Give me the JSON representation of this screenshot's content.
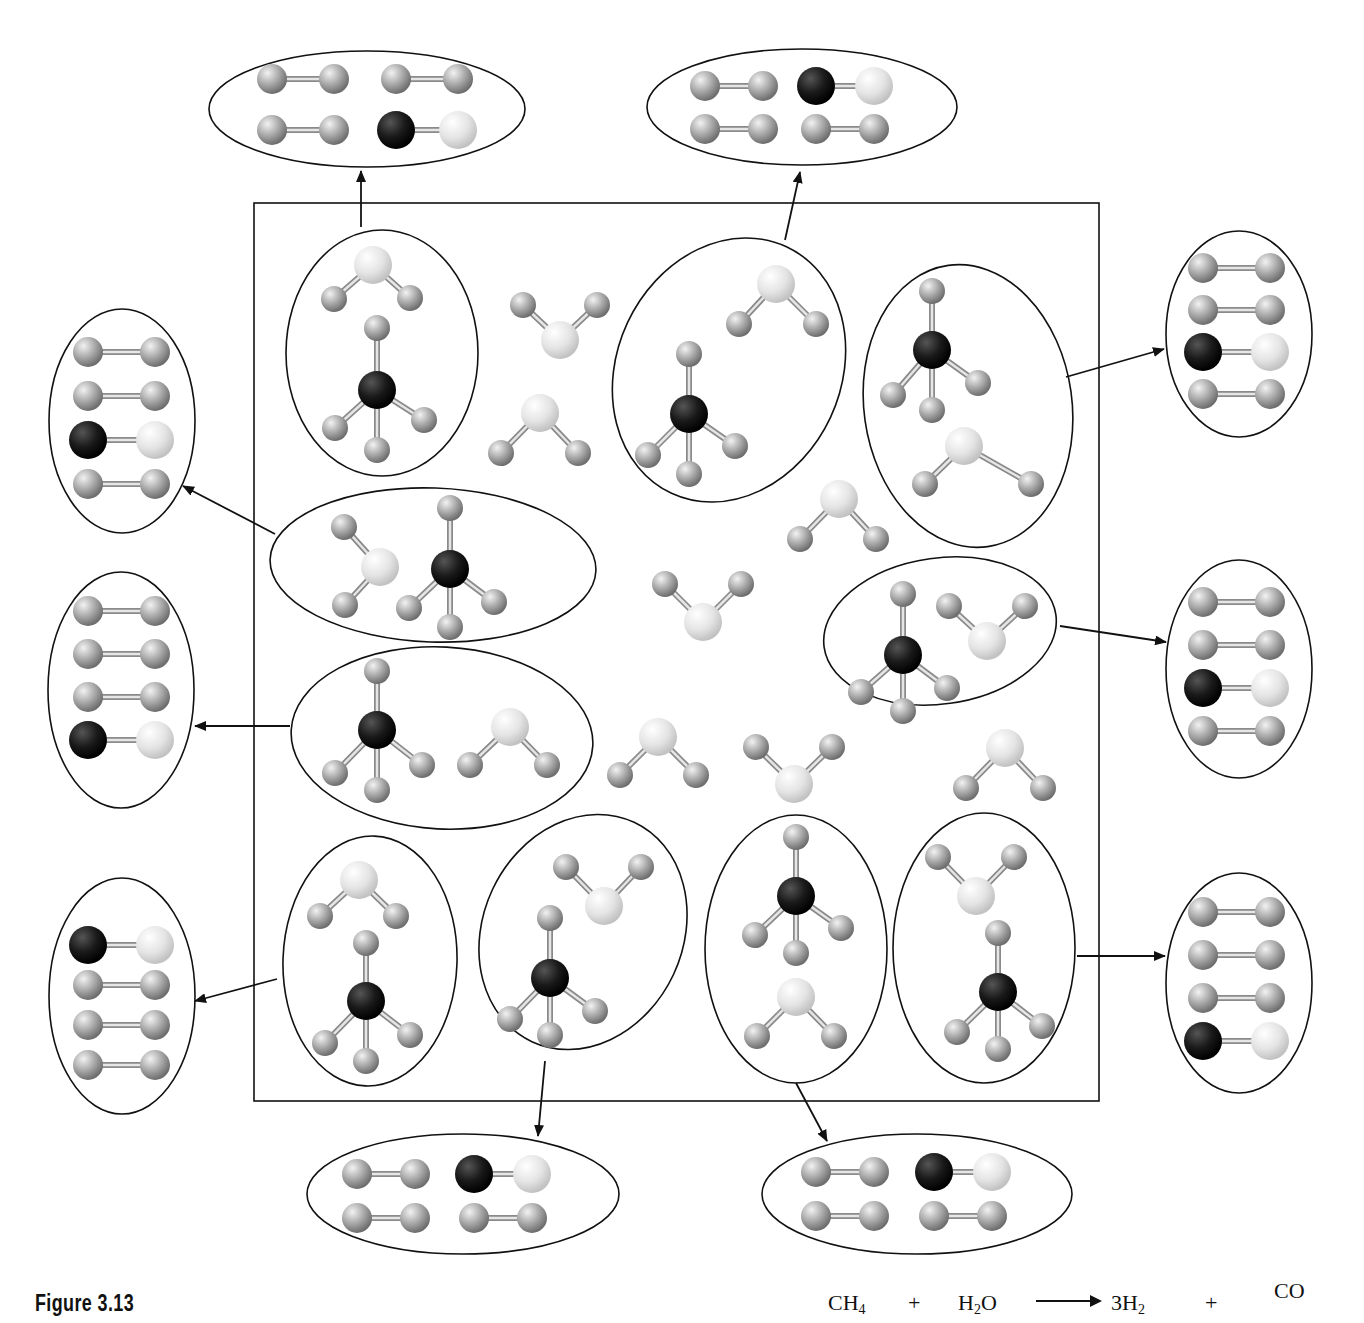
{
  "figure": {
    "caption": "Figure 3.13",
    "equation": {
      "reactant1": "CH",
      "reactant1_sub": "4",
      "plus1": "+",
      "reactant2_a": "H",
      "reactant2_sub": "2",
      "reactant2_b": "O",
      "arrow": "yields-arrow",
      "product1": "3H",
      "product1_sub": "2",
      "plus2": "+",
      "product2": "CO"
    }
  },
  "colors": {
    "carbon": "#111111",
    "oxygen": "#e4e4e4",
    "hydrogen": "#a9a9a9",
    "outline": "#111111",
    "bond": "#bdbdbd"
  },
  "box": {
    "x": 254,
    "y": 203,
    "w": 845,
    "h": 898
  },
  "reactant_groups": [
    {
      "id": "g1",
      "cx": 382,
      "cy": 353,
      "rx": 96,
      "ry": 123,
      "rot": 0
    },
    {
      "id": "g2",
      "cx": 729,
      "cy": 370,
      "rx": 112,
      "ry": 136,
      "rot": 25
    },
    {
      "id": "g3",
      "cx": 968,
      "cy": 406,
      "rx": 104,
      "ry": 142,
      "rot": -8
    },
    {
      "id": "g4",
      "cx": 433,
      "cy": 565,
      "rx": 163,
      "ry": 77,
      "rot": 2
    },
    {
      "id": "g5",
      "cx": 940,
      "cy": 631,
      "rx": 117,
      "ry": 73,
      "rot": -8
    },
    {
      "id": "g6",
      "cx": 442,
      "cy": 738,
      "rx": 151,
      "ry": 91,
      "rot": 3
    },
    {
      "id": "g7",
      "cx": 370,
      "cy": 961,
      "rx": 87,
      "ry": 125,
      "rot": 2
    },
    {
      "id": "g8",
      "cx": 583,
      "cy": 932,
      "rx": 100,
      "ry": 121,
      "rot": 25
    },
    {
      "id": "g9",
      "cx": 796,
      "cy": 949,
      "rx": 91,
      "ry": 134,
      "rot": 0
    },
    {
      "id": "g10",
      "cx": 984,
      "cy": 948,
      "rx": 91,
      "ry": 135,
      "rot": 0
    }
  ],
  "methane": [
    {
      "cx": 377,
      "cy": 390,
      "h": [
        [
          377,
          328
        ],
        [
          335,
          428
        ],
        [
          377,
          450
        ],
        [
          424,
          420
        ]
      ]
    },
    {
      "cx": 689,
      "cy": 414,
      "h": [
        [
          689,
          354
        ],
        [
          648,
          455
        ],
        [
          689,
          474
        ],
        [
          735,
          446
        ]
      ]
    },
    {
      "cx": 932,
      "cy": 350,
      "h": [
        [
          932,
          291
        ],
        [
          893,
          395
        ],
        [
          932,
          410
        ],
        [
          978,
          383
        ]
      ]
    },
    {
      "cx": 450,
      "cy": 569,
      "h": [
        [
          450,
          508
        ],
        [
          409,
          608
        ],
        [
          450,
          627
        ],
        [
          494,
          602
        ]
      ]
    },
    {
      "cx": 903,
      "cy": 655,
      "h": [
        [
          903,
          594
        ],
        [
          861,
          692
        ],
        [
          903,
          711
        ],
        [
          947,
          688
        ]
      ]
    },
    {
      "cx": 377,
      "cy": 730,
      "h": [
        [
          377,
          671
        ],
        [
          335,
          773
        ],
        [
          377,
          790
        ],
        [
          422,
          765
        ]
      ]
    },
    {
      "cx": 366,
      "cy": 1001,
      "h": [
        [
          366,
          943
        ],
        [
          325,
          1043
        ],
        [
          366,
          1061
        ],
        [
          410,
          1035
        ]
      ]
    },
    {
      "cx": 550,
      "cy": 978,
      "h": [
        [
          550,
          918
        ],
        [
          510,
          1019
        ],
        [
          550,
          1035
        ],
        [
          595,
          1011
        ]
      ]
    },
    {
      "cx": 796,
      "cy": 896,
      "h": [
        [
          796,
          837
        ],
        [
          755,
          935
        ],
        [
          796,
          953
        ],
        [
          841,
          928
        ]
      ]
    },
    {
      "cx": 998,
      "cy": 992,
      "h": [
        [
          998,
          933
        ],
        [
          957,
          1032
        ],
        [
          998,
          1049
        ],
        [
          1042,
          1026
        ]
      ]
    }
  ],
  "water": [
    {
      "o": [
        373,
        265
      ],
      "h": [
        [
          334,
          299
        ],
        [
          410,
          298
        ]
      ]
    },
    {
      "o": [
        560,
        340
      ],
      "h": [
        [
          523,
          305
        ],
        [
          597,
          305
        ]
      ]
    },
    {
      "o": [
        540,
        413
      ],
      "h": [
        [
          501,
          453
        ],
        [
          578,
          453
        ]
      ]
    },
    {
      "o": [
        776,
        284
      ],
      "h": [
        [
          739,
          324
        ],
        [
          816,
          324
        ]
      ]
    },
    {
      "o": [
        964,
        446
      ],
      "h": [
        [
          925,
          484
        ],
        [
          1031,
          484
        ]
      ]
    },
    {
      "o": [
        839,
        499
      ],
      "h": [
        [
          800,
          539
        ],
        [
          876,
          539
        ]
      ]
    },
    {
      "o": [
        380,
        567
      ],
      "h": [
        [
          344,
          527
        ],
        [
          345,
          605
        ]
      ]
    },
    {
      "o": [
        703,
        622
      ],
      "h": [
        [
          665,
          584
        ],
        [
          741,
          584
        ]
      ]
    },
    {
      "o": [
        987,
        641
      ],
      "h": [
        [
          949,
          606
        ],
        [
          1025,
          606
        ]
      ]
    },
    {
      "o": [
        510,
        727
      ],
      "h": [
        [
          470,
          765
        ],
        [
          547,
          765
        ]
      ]
    },
    {
      "o": [
        658,
        737
      ],
      "h": [
        [
          620,
          775
        ],
        [
          696,
          775
        ]
      ]
    },
    {
      "o": [
        794,
        784
      ],
      "h": [
        [
          756,
          747
        ],
        [
          832,
          747
        ]
      ]
    },
    {
      "o": [
        1005,
        748
      ],
      "h": [
        [
          966,
          788
        ],
        [
          1043,
          788
        ]
      ]
    },
    {
      "o": [
        359,
        880
      ],
      "h": [
        [
          320,
          916
        ],
        [
          396,
          916
        ]
      ]
    },
    {
      "o": [
        604,
        906
      ],
      "h": [
        [
          566,
          867
        ],
        [
          641,
          867
        ]
      ]
    },
    {
      "o": [
        796,
        997
      ],
      "h": [
        [
          757,
          1036
        ],
        [
          834,
          1036
        ]
      ]
    },
    {
      "o": [
        976,
        896
      ],
      "h": [
        [
          938,
          857
        ],
        [
          1014,
          857
        ]
      ]
    }
  ],
  "product_groups": [
    {
      "id": "p-top-left",
      "cx": 367,
      "cy": 109,
      "rx": 158,
      "ry": 58,
      "layout": "grid",
      "rows": [
        [
          "HH",
          "HH"
        ],
        [
          "HH",
          "CO"
        ]
      ],
      "origin": [
        272,
        79
      ],
      "dx": 124,
      "dy": 51,
      "len": 62,
      "arrow": {
        "from": [
          361,
          227
        ],
        "to": [
          361,
          171
        ]
      }
    },
    {
      "id": "p-top-right",
      "cx": 802,
      "cy": 107,
      "rx": 155,
      "ry": 58,
      "layout": "grid",
      "rows": [
        [
          "HH",
          "CO"
        ],
        [
          "HH",
          "HH"
        ]
      ],
      "origin": [
        705,
        86
      ],
      "dx": 111,
      "dy": 43,
      "len": 58,
      "arrow": {
        "from": [
          785,
          240
        ],
        "to": [
          800,
          172
        ]
      }
    },
    {
      "id": "p-left-1",
      "cx": 122,
      "cy": 421,
      "rx": 73,
      "ry": 112,
      "layout": "column",
      "rows": [
        "HH",
        "HH",
        "CO",
        "HH"
      ],
      "origin": [
        88,
        352
      ],
      "dy": 44,
      "len": 67,
      "arrow": {
        "from": [
          275,
          534
        ],
        "to": [
          183,
          486
        ]
      }
    },
    {
      "id": "p-left-2",
      "cx": 121,
      "cy": 690,
      "rx": 73,
      "ry": 118,
      "layout": "column",
      "rows": [
        "HH",
        "HH",
        "HH",
        "CO"
      ],
      "origin": [
        88,
        611
      ],
      "dy": 43,
      "len": 67,
      "arrow": {
        "from": [
          290,
          726
        ],
        "to": [
          195,
          726
        ]
      }
    },
    {
      "id": "p-left-3",
      "cx": 122,
      "cy": 996,
      "rx": 73,
      "ry": 118,
      "layout": "column",
      "rows": [
        "CO",
        "HH",
        "HH",
        "HH"
      ],
      "origin": [
        88,
        945
      ],
      "dy": 40,
      "len": 67,
      "arrow": {
        "from": [
          277,
          979
        ],
        "to": [
          195,
          1001
        ]
      }
    },
    {
      "id": "p-right-1",
      "cx": 1239,
      "cy": 334,
      "rx": 73,
      "ry": 103,
      "layout": "column",
      "rows": [
        "HH",
        "HH",
        "CO",
        "HH"
      ],
      "origin": [
        1203,
        268
      ],
      "dy": 42,
      "len": 67,
      "arrow": {
        "from": [
          1066,
          377
        ],
        "to": [
          1164,
          349
        ]
      }
    },
    {
      "id": "p-right-2",
      "cx": 1239,
      "cy": 669,
      "rx": 73,
      "ry": 109,
      "layout": "column",
      "rows": [
        "HH",
        "HH",
        "CO",
        "HH"
      ],
      "origin": [
        1203,
        602
      ],
      "dy": 43,
      "len": 67,
      "arrow": {
        "from": [
          1060,
          626
        ],
        "to": [
          1166,
          642
        ]
      }
    },
    {
      "id": "p-right-3",
      "cx": 1239,
      "cy": 983,
      "rx": 73,
      "ry": 110,
      "layout": "column",
      "rows": [
        "HH",
        "HH",
        "HH",
        "CO"
      ],
      "origin": [
        1203,
        912
      ],
      "dy": 43,
      "len": 67,
      "arrow": {
        "from": [
          1077,
          956
        ],
        "to": [
          1165,
          956
        ]
      }
    },
    {
      "id": "p-bottom-left",
      "cx": 463,
      "cy": 1194,
      "rx": 156,
      "ry": 60,
      "layout": "grid",
      "rows": [
        [
          "HH",
          "CO"
        ],
        [
          "HH",
          "HH"
        ]
      ],
      "origin": [
        357,
        1174
      ],
      "dx": 117,
      "dy": 44,
      "len": 58,
      "arrow": {
        "from": [
          545,
          1061
        ],
        "to": [
          538,
          1136
        ]
      }
    },
    {
      "id": "p-bottom-right",
      "cx": 917,
      "cy": 1194,
      "rx": 155,
      "ry": 60,
      "layout": "grid",
      "rows": [
        [
          "HH",
          "CO"
        ],
        [
          "HH",
          "HH"
        ]
      ],
      "origin": [
        816,
        1172
      ],
      "dx": 118,
      "dy": 44,
      "len": 58,
      "arrow": {
        "from": [
          796,
          1083
        ],
        "to": [
          827,
          1141
        ]
      }
    }
  ]
}
